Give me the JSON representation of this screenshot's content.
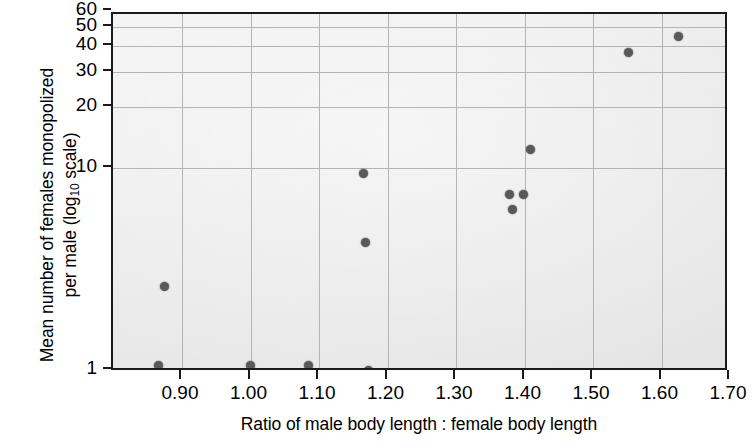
{
  "figure": {
    "background_color": "#ffffff",
    "plot_background_color": "#ededed",
    "axis_color": "#1a1a1a",
    "grid_color": "#b4b4b4",
    "point_color": "#595959",
    "y_axis_title_line1": "Mean number of females monopolized",
    "y_axis_title_line2_pre": "per male (log",
    "y_axis_title_sub": "10",
    "y_axis_title_line2_post": " scale)",
    "x_axis_title": "Ratio of male body length : female body length"
  },
  "chart_data": {
    "type": "scatter",
    "title": "",
    "xlabel": "Ratio of male body length : female body length",
    "ylabel": "Mean number of females monopolized per male (log10 scale)",
    "yscale": "log10",
    "xlim": [
      0.855,
      1.705
    ],
    "ylim": [
      1,
      60
    ],
    "grid": true,
    "legend": "none",
    "xticks": [
      "0.90",
      "1.00",
      "1.10",
      "1.20",
      "1.30",
      "1.40",
      "1.50",
      "1.60",
      "1.70"
    ],
    "xtick_values": [
      0.9,
      1.0,
      1.1,
      1.2,
      1.3,
      1.4,
      1.5,
      1.6,
      1.7
    ],
    "yticks": [
      "1",
      "10",
      "20",
      "30",
      "40",
      "50",
      "60"
    ],
    "ytick_values": [
      1,
      10,
      20,
      30,
      40,
      50,
      60
    ],
    "x": [
      0.865,
      0.875,
      1.0,
      1.085,
      1.165,
      1.168,
      1.172,
      1.378,
      1.382,
      1.398,
      1.408,
      1.552,
      1.625
    ],
    "y": [
      1.05,
      2.6,
      1.05,
      1.05,
      9.4,
      4.3,
      1.0,
      7.4,
      6.2,
      7.4,
      12.3,
      37.5,
      45.0
    ],
    "points": [
      {
        "x": 0.865,
        "y": 1.05
      },
      {
        "x": 0.875,
        "y": 2.6
      },
      {
        "x": 1.0,
        "y": 1.05
      },
      {
        "x": 1.085,
        "y": 1.05
      },
      {
        "x": 1.165,
        "y": 9.4
      },
      {
        "x": 1.168,
        "y": 4.3
      },
      {
        "x": 1.172,
        "y": 1.0
      },
      {
        "x": 1.378,
        "y": 7.4
      },
      {
        "x": 1.382,
        "y": 6.2
      },
      {
        "x": 1.398,
        "y": 7.4
      },
      {
        "x": 1.408,
        "y": 12.3
      },
      {
        "x": 1.552,
        "y": 37.5
      },
      {
        "x": 1.625,
        "y": 45.0
      }
    ]
  }
}
